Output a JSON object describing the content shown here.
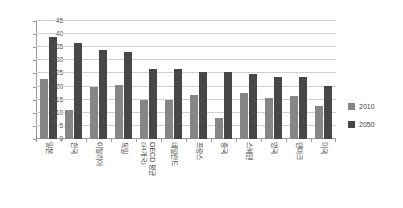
{
  "chart_data": {
    "type": "bar",
    "title": "",
    "subtitle": "",
    "xlabel": "",
    "ylabel": "",
    "ylim": [
      0,
      45
    ],
    "yticks": [
      0,
      5,
      10,
      15,
      20,
      25,
      30,
      35,
      40,
      45
    ],
    "ytick_labels": [
      "0",
      "5",
      "10",
      "15",
      "20",
      "25",
      "30",
      "35",
      "40",
      "45"
    ],
    "grid": true,
    "legend_position": "right",
    "categories": [
      "일본",
      "한국",
      "이탈리아",
      "독일",
      "OECD 평균",
      "네덜란드",
      "프랑스",
      "중국",
      "스웨덴",
      "영국",
      "덴마크",
      "미국"
    ],
    "category_sublabels": [
      "",
      "",
      "",
      "",
      "(34개국)",
      "",
      "",
      "",
      "",
      "",
      "",
      ""
    ],
    "series": [
      {
        "name": "2010",
        "color": "#868686",
        "values": [
          23.0,
          11.0,
          20.0,
          20.7,
          15.0,
          15.0,
          16.7,
          8.0,
          17.6,
          15.7,
          16.4,
          12.5
        ]
      },
      {
        "name": "2050",
        "color": "#474747",
        "values": [
          39.0,
          36.5,
          34.0,
          33.0,
          26.7,
          26.7,
          25.7,
          25.7,
          24.8,
          23.7,
          23.5,
          20.3
        ]
      }
    ]
  },
  "legend": {
    "items": [
      {
        "label": "2010",
        "color": "#868686"
      },
      {
        "label": "2050",
        "color": "#474747"
      }
    ]
  },
  "colors": {
    "series_2010": "#868686",
    "series_2050": "#474747",
    "grid": "#cfcfcf",
    "axis": "#9a9a9a",
    "text": "#3c3c3c",
    "background": "#ffffff"
  }
}
